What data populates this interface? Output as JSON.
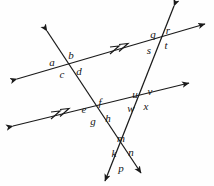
{
  "figure": {
    "type": "geometry-diagram",
    "width": 214,
    "height": 186,
    "background_color": "#fefefe",
    "stroke_color": "#1a1a1a",
    "label_color": "#151515",
    "lines": [
      {
        "id": "upper-parallel-line",
        "name": "upper parallel transversal",
        "from": [
          17,
          79
        ],
        "to": [
          205,
          24
        ],
        "arrow_start": true,
        "arrow_end": true,
        "parallel_ticks": 2,
        "tick_position": [
          119,
          48
        ]
      },
      {
        "id": "lower-parallel-line",
        "name": "lower parallel transversal",
        "from": [
          13,
          126
        ],
        "to": [
          189,
          83
        ],
        "arrow_start": true,
        "arrow_end": true,
        "parallel_ticks": 2,
        "tick_position": [
          60,
          113
        ]
      },
      {
        "id": "left-oblique-line",
        "name": "left oblique line through a-b-c-d, e-f-g-h, k-m-n-p",
        "from": [
          47,
          31
        ],
        "to": [
          141,
          173
        ],
        "arrow_start": true,
        "arrow_end": true
      },
      {
        "id": "right-oblique-line",
        "name": "right oblique line through q-r-s-t, u-v-w-x, k-m-n-p",
        "from": [
          174,
          6
        ],
        "to": [
          105,
          181
        ],
        "arrow_start": true,
        "arrow_end": true
      }
    ],
    "intersections": [
      {
        "id": "intersection-abcd",
        "point": [
          63,
          62
        ],
        "labels": [
          "a",
          "b",
          "c",
          "d"
        ]
      },
      {
        "id": "intersection-qrst",
        "point": [
          160,
          38
        ],
        "labels": [
          "q",
          "r",
          "s",
          "t"
        ]
      },
      {
        "id": "intersection-efgh",
        "point": [
          95,
          107
        ],
        "labels": [
          "e",
          "f",
          "g",
          "h"
        ]
      },
      {
        "id": "intersection-uvwx",
        "point": [
          141,
          100
        ],
        "labels": [
          "u",
          "v",
          "w",
          "x"
        ]
      },
      {
        "id": "intersection-kmnp",
        "point": [
          123,
          152
        ],
        "labels": [
          "k",
          "m",
          "n",
          "p"
        ]
      }
    ],
    "labels": [
      {
        "id": "label-a",
        "text": "a",
        "x": 52,
        "y": 62
      },
      {
        "id": "label-b",
        "text": "b",
        "x": 71,
        "y": 55
      },
      {
        "id": "label-c",
        "text": "c",
        "x": 62,
        "y": 74
      },
      {
        "id": "label-d",
        "text": "d",
        "x": 79,
        "y": 71
      },
      {
        "id": "label-q",
        "text": "q",
        "x": 153,
        "y": 34
      },
      {
        "id": "label-r",
        "text": "r",
        "x": 168,
        "y": 30
      },
      {
        "id": "label-s",
        "text": "s",
        "x": 149,
        "y": 50
      },
      {
        "id": "label-t",
        "text": "t",
        "x": 166,
        "y": 45
      },
      {
        "id": "label-e",
        "text": "e",
        "x": 84,
        "y": 109
      },
      {
        "id": "label-f",
        "text": "f",
        "x": 100,
        "y": 102
      },
      {
        "id": "label-g",
        "text": "g",
        "x": 93,
        "y": 121
      },
      {
        "id": "label-h",
        "text": "h",
        "x": 108,
        "y": 118
      },
      {
        "id": "label-u",
        "text": "u",
        "x": 135,
        "y": 94
      },
      {
        "id": "label-v",
        "text": "v",
        "x": 150,
        "y": 91
      },
      {
        "id": "label-w",
        "text": "w",
        "x": 131,
        "y": 108
      },
      {
        "id": "label-x",
        "text": "x",
        "x": 146,
        "y": 106
      },
      {
        "id": "label-m",
        "text": "m",
        "x": 121,
        "y": 138
      },
      {
        "id": "label-k",
        "text": "k",
        "x": 114,
        "y": 153
      },
      {
        "id": "label-n",
        "text": "n",
        "x": 131,
        "y": 152
      },
      {
        "id": "label-p",
        "text": "p",
        "x": 121,
        "y": 168
      }
    ]
  }
}
